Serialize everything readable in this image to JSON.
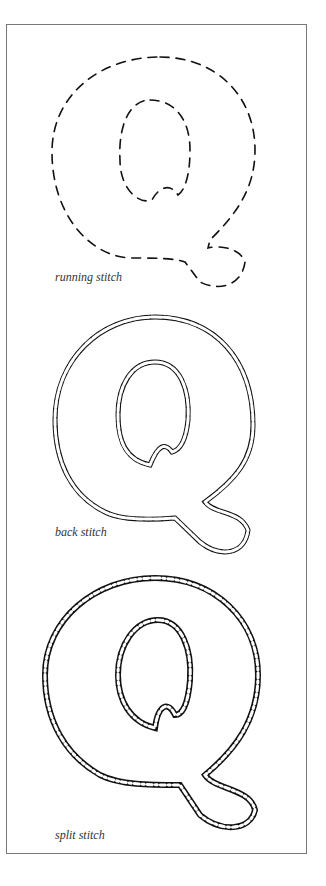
{
  "figure": {
    "letter": "Q",
    "ink_color": "#111111",
    "frame_color": "#777777",
    "panels": [
      {
        "label": "running stitch",
        "style": "running"
      },
      {
        "label": "back stitch",
        "style": "back"
      },
      {
        "label": "split stitch",
        "style": "split"
      }
    ]
  }
}
